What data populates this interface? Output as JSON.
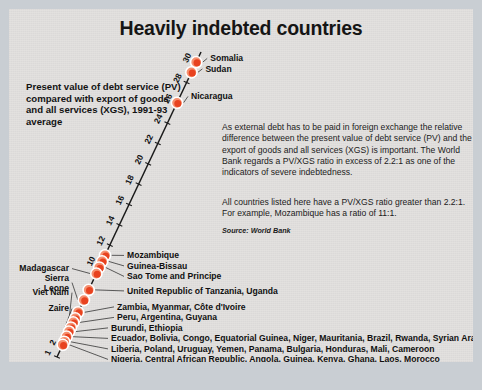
{
  "title": "Heavily indebted countries",
  "lead": "Present value of debt service (PV) compared with export of goods and all services (XGS), 1991-93 average",
  "body": {
    "paragraph1": "As external debt has to be paid in foreign exchange the relative difference between the present value of debt service (PV) and the export of goods and all services (XGS) is important. The World Bank regards a PV/XGS ratio in excess of 2.2:1 as one of the indicators of severe indebtedness.",
    "paragraph2": "All countries listed here have a PV/XGS ratio greater than 2.2:1. For example, Mozambique has a ratio of 11:1.",
    "source": "Source: World Bank"
  },
  "colors": {
    "marker_fill": "#e8421f",
    "marker_highlight": "#f59070",
    "marker_outline": "#ffffff",
    "panel_bg": "#e3e1df",
    "page_bg": "#c9ced3",
    "text": "#131313"
  },
  "chart_data": {
    "type": "scatter",
    "title": "Heavily indebted countries",
    "xlabel": "",
    "ylabel": "PV/XGS ratio",
    "axis_orientation": "diagonal",
    "ylim": [
      1,
      31
    ],
    "grid": false,
    "legend": "none",
    "tick_labels": [
      30,
      28,
      26,
      24,
      22,
      20,
      18,
      16,
      14,
      12,
      10,
      2,
      1
    ],
    "points": [
      {
        "value": 30,
        "label": "Somalia",
        "side": "right"
      },
      {
        "value": 29,
        "label": "Sudan",
        "side": "right"
      },
      {
        "value": 26,
        "label": "Nicaragua",
        "side": "right"
      },
      {
        "value": 11,
        "label": "Mozambique",
        "side": "right"
      },
      {
        "value": 10.4,
        "label": "Guinea-Bissau",
        "side": "right"
      },
      {
        "value": 9.8,
        "label": "Sao Tome and Principe",
        "side": "right"
      },
      {
        "value": 9.2,
        "label": "Madagascar",
        "side": "left"
      },
      {
        "value": 7.6,
        "label": "United Republic of Tanzania, Uganda",
        "side": "right"
      },
      {
        "value": 6.6,
        "label": "Sierra Leone",
        "side": "left"
      },
      {
        "value": 5.4,
        "label": "Zambia, Myanmar, Côte d'Ivoire",
        "side": "right"
      },
      {
        "value": 4.8,
        "label": "Viet Nam",
        "side": "left"
      },
      {
        "value": 4.4,
        "label": "Peru, Argentina, Guyana",
        "side": "right"
      },
      {
        "value": 3.9,
        "label": "Zaire",
        "side": "left"
      },
      {
        "value": 3.5,
        "label": "Burundi, Ethiopia",
        "side": "right"
      },
      {
        "value": 3.0,
        "label": "Ecuador, Bolivia, Congo, Equatorial Guinea, Niger, Mauritania, Brazil, Rwanda, Syrian Arab Republic",
        "side": "right"
      },
      {
        "value": 2.5,
        "label": "Liberia, Poland, Uruguay, Yemen, Panama, Bulgaria, Honduras, Mali, Cameroon",
        "side": "right"
      },
      {
        "value": 2.2,
        "label": "Nigeria, Central African Republic, Angola, Guinea, Kenya, Ghana, Laos, Morocco",
        "side": "right"
      }
    ]
  }
}
